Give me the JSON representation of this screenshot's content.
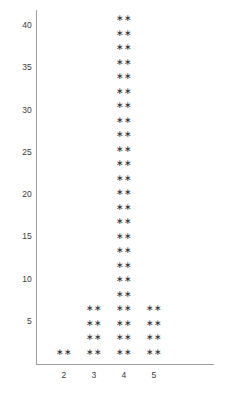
{
  "chart_data": {
    "type": "scatter",
    "title": "",
    "subtitle": "",
    "xlabel": "",
    "ylabel": "",
    "marker_glyph": "∗∗",
    "marker_label": "asterisk-pair",
    "grid": false,
    "legend": null,
    "xlim": [
      1.5,
      6.0
    ],
    "ylim": [
      0,
      42
    ],
    "x_tick_labels": [
      "2",
      "3",
      "4",
      "5"
    ],
    "x_values": [
      2,
      3,
      4,
      5
    ],
    "y_tick_labels": [
      "5",
      "10",
      "15",
      "20",
      "25",
      "30",
      "35",
      "40"
    ],
    "y_values": [
      5,
      10,
      15,
      20,
      25,
      30,
      35,
      40
    ],
    "categories": [
      "2",
      "3",
      "4",
      "5"
    ],
    "values": [
      1,
      4,
      24,
      4
    ],
    "series": [
      {
        "name": "count",
        "values": [
          1,
          4,
          24,
          4
        ]
      }
    ],
    "points": [
      {
        "x": 2,
        "stack": 1
      },
      {
        "x": 3,
        "stack": 4
      },
      {
        "x": 4,
        "stack": 24
      },
      {
        "x": 5,
        "stack": 4
      }
    ],
    "annotations": []
  },
  "axes": {
    "y_axis_name": "y-axis",
    "x_axis_name": "x-axis"
  },
  "colors": {
    "marker": "#2b2b2b",
    "axis": "#a0a0a0",
    "tick_label": "#3a3a3a",
    "background": "#ffffff"
  }
}
